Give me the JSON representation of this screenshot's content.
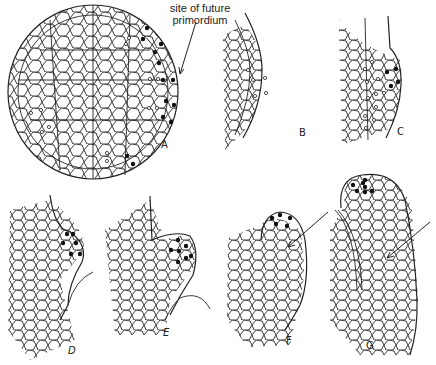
{
  "figure": {
    "annotation": {
      "line1": "site of future",
      "line2": "primordium"
    },
    "panels": [
      {
        "id": "A",
        "label": "A"
      },
      {
        "id": "B",
        "label": "B"
      },
      {
        "id": "C",
        "label": "C"
      },
      {
        "id": "D",
        "label": "D"
      },
      {
        "id": "E",
        "label": "E"
      },
      {
        "id": "F",
        "label": "F"
      },
      {
        "id": "G",
        "label": "G"
      }
    ],
    "legend_symbols": {
      "filled_dot": "solid nucleus marker",
      "open_circle": "open nucleus marker"
    },
    "colors": {
      "ink": "#222222",
      "background": "#ffffff"
    }
  }
}
